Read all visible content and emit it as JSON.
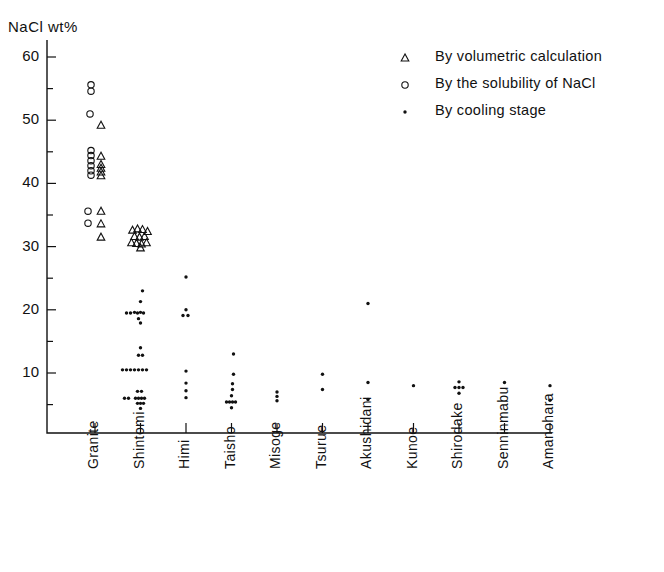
{
  "chart_data": {
    "type": "scatter",
    "title": "",
    "ylabel": "NaCl  wt%",
    "xlabel": "",
    "ylim": [
      2,
      62
    ],
    "yticks": [
      10,
      20,
      30,
      40,
      50,
      60
    ],
    "yminorticks": [
      5,
      15,
      25,
      35,
      45,
      55
    ],
    "grid": false,
    "legend_position": "top-right",
    "categories": [
      "Granite",
      "Shintomi",
      "Himi",
      "Taisho",
      "Misoge",
      "Tsurue",
      "Akushidani",
      "Kunoe",
      "Shirodake",
      "Senninmabu",
      "Amanohara"
    ],
    "series": [
      {
        "name": "By volumetric calculation",
        "marker": "open-triangle",
        "points": [
          {
            "category": "Granite",
            "x_offset": 6,
            "value": 49.2
          },
          {
            "category": "Granite",
            "x_offset": 6,
            "value": 44.3
          },
          {
            "category": "Granite",
            "x_offset": 6,
            "value": 43.0
          },
          {
            "category": "Granite",
            "x_offset": 6,
            "value": 42.4
          },
          {
            "category": "Granite",
            "x_offset": 6,
            "value": 41.8
          },
          {
            "category": "Granite",
            "x_offset": 6,
            "value": 41.2
          },
          {
            "category": "Granite",
            "x_offset": 6,
            "value": 35.6
          },
          {
            "category": "Granite",
            "x_offset": 6,
            "value": 33.6
          },
          {
            "category": "Granite",
            "x_offset": 6,
            "value": 31.5
          },
          {
            "category": "Shintomi",
            "x_offset": -8,
            "value": 32.6
          },
          {
            "category": "Shintomi",
            "x_offset": -3,
            "value": 32.8
          },
          {
            "category": "Shintomi",
            "x_offset": 2,
            "value": 32.7
          },
          {
            "category": "Shintomi",
            "x_offset": 7,
            "value": 32.4
          },
          {
            "category": "Shintomi",
            "x_offset": -6,
            "value": 31.6
          },
          {
            "category": "Shintomi",
            "x_offset": -1,
            "value": 31.5
          },
          {
            "category": "Shintomi",
            "x_offset": 4,
            "value": 31.6
          },
          {
            "category": "Shintomi",
            "x_offset": -9,
            "value": 30.6
          },
          {
            "category": "Shintomi",
            "x_offset": -4,
            "value": 30.5
          },
          {
            "category": "Shintomi",
            "x_offset": 1,
            "value": 30.4
          },
          {
            "category": "Shintomi",
            "x_offset": 6,
            "value": 30.6
          },
          {
            "category": "Shintomi",
            "x_offset": 0,
            "value": 29.8
          }
        ]
      },
      {
        "name": "By the solubility of NaCl",
        "marker": "open-circle",
        "points": [
          {
            "category": "Granite",
            "x_offset": -4,
            "value": 55.6
          },
          {
            "category": "Granite",
            "x_offset": -4,
            "value": 54.6
          },
          {
            "category": "Granite",
            "x_offset": -5,
            "value": 51.0
          },
          {
            "category": "Granite",
            "x_offset": -4,
            "value": 45.2
          },
          {
            "category": "Granite",
            "x_offset": -4,
            "value": 44.4
          },
          {
            "category": "Granite",
            "x_offset": -4,
            "value": 43.6
          },
          {
            "category": "Granite",
            "x_offset": -4,
            "value": 42.8
          },
          {
            "category": "Granite",
            "x_offset": -4,
            "value": 42.0
          },
          {
            "category": "Granite",
            "x_offset": -4,
            "value": 41.3
          },
          {
            "category": "Granite",
            "x_offset": -7,
            "value": 35.6
          },
          {
            "category": "Granite",
            "x_offset": -7,
            "value": 33.7
          }
        ]
      },
      {
        "name": "By cooling stage",
        "marker": "filled-dot",
        "points": [
          {
            "category": "Shintomi",
            "x_offset": 2,
            "value": 23.0
          },
          {
            "category": "Shintomi",
            "x_offset": 0,
            "value": 21.3
          },
          {
            "category": "Shintomi",
            "x_offset": -14,
            "value": 19.5
          },
          {
            "category": "Shintomi",
            "x_offset": -10,
            "value": 19.5
          },
          {
            "category": "Shintomi",
            "x_offset": -6,
            "value": 19.6
          },
          {
            "category": "Shintomi",
            "x_offset": -3,
            "value": 19.5
          },
          {
            "category": "Shintomi",
            "x_offset": 0,
            "value": 19.6
          },
          {
            "category": "Shintomi",
            "x_offset": 3,
            "value": 19.5
          },
          {
            "category": "Shintomi",
            "x_offset": -2,
            "value": 18.6
          },
          {
            "category": "Shintomi",
            "x_offset": 0,
            "value": 17.9
          },
          {
            "category": "Shintomi",
            "x_offset": 0,
            "value": 14.0
          },
          {
            "category": "Shintomi",
            "x_offset": -2,
            "value": 12.8
          },
          {
            "category": "Shintomi",
            "x_offset": 2,
            "value": 12.8
          },
          {
            "category": "Shintomi",
            "x_offset": -18,
            "value": 10.5
          },
          {
            "category": "Shintomi",
            "x_offset": -14,
            "value": 10.5
          },
          {
            "category": "Shintomi",
            "x_offset": -10,
            "value": 10.5
          },
          {
            "category": "Shintomi",
            "x_offset": -6,
            "value": 10.5
          },
          {
            "category": "Shintomi",
            "x_offset": -2,
            "value": 10.5
          },
          {
            "category": "Shintomi",
            "x_offset": 2,
            "value": 10.5
          },
          {
            "category": "Shintomi",
            "x_offset": 6,
            "value": 10.5
          },
          {
            "category": "Shintomi",
            "x_offset": -3,
            "value": 7.1
          },
          {
            "category": "Shintomi",
            "x_offset": 1,
            "value": 7.1
          },
          {
            "category": "Shintomi",
            "x_offset": -16,
            "value": 6.0
          },
          {
            "category": "Shintomi",
            "x_offset": -12,
            "value": 6.0
          },
          {
            "category": "Shintomi",
            "x_offset": -5,
            "value": 6.0
          },
          {
            "category": "Shintomi",
            "x_offset": -2,
            "value": 6.0
          },
          {
            "category": "Shintomi",
            "x_offset": 1,
            "value": 6.0
          },
          {
            "category": "Shintomi",
            "x_offset": 4,
            "value": 6.0
          },
          {
            "category": "Shintomi",
            "x_offset": -3,
            "value": 5.2
          },
          {
            "category": "Shintomi",
            "x_offset": 0,
            "value": 5.2
          },
          {
            "category": "Shintomi",
            "x_offset": 3,
            "value": 5.2
          },
          {
            "category": "Shintomi",
            "x_offset": 0,
            "value": 4.4
          },
          {
            "category": "Himi",
            "x_offset": 0,
            "value": 25.2
          },
          {
            "category": "Himi",
            "x_offset": 0,
            "value": 20.0
          },
          {
            "category": "Himi",
            "x_offset": -3,
            "value": 19.1
          },
          {
            "category": "Himi",
            "x_offset": 2,
            "value": 19.1
          },
          {
            "category": "Himi",
            "x_offset": 0,
            "value": 10.3
          },
          {
            "category": "Himi",
            "x_offset": 0,
            "value": 8.4
          },
          {
            "category": "Himi",
            "x_offset": 0,
            "value": 7.2
          },
          {
            "category": "Himi",
            "x_offset": 0,
            "value": 6.1
          },
          {
            "category": "Taisho",
            "x_offset": 2,
            "value": 13.0
          },
          {
            "category": "Taisho",
            "x_offset": 2,
            "value": 9.8
          },
          {
            "category": "Taisho",
            "x_offset": 1,
            "value": 8.3
          },
          {
            "category": "Taisho",
            "x_offset": 1,
            "value": 7.4
          },
          {
            "category": "Taisho",
            "x_offset": 0,
            "value": 6.4
          },
          {
            "category": "Taisho",
            "x_offset": -5,
            "value": 5.4
          },
          {
            "category": "Taisho",
            "x_offset": -2,
            "value": 5.4
          },
          {
            "category": "Taisho",
            "x_offset": 1,
            "value": 5.4
          },
          {
            "category": "Taisho",
            "x_offset": 4,
            "value": 5.4
          },
          {
            "category": "Taisho",
            "x_offset": 0,
            "value": 4.5
          },
          {
            "category": "Misoge",
            "x_offset": 0,
            "value": 7.0
          },
          {
            "category": "Misoge",
            "x_offset": 0,
            "value": 6.3
          },
          {
            "category": "Misoge",
            "x_offset": 0,
            "value": 5.6
          },
          {
            "category": "Tsurue",
            "x_offset": 0,
            "value": 9.8
          },
          {
            "category": "Tsurue",
            "x_offset": 0,
            "value": 7.4
          },
          {
            "category": "Akushidani",
            "x_offset": 0,
            "value": 21.0
          },
          {
            "category": "Akushidani",
            "x_offset": 0,
            "value": 8.5
          },
          {
            "category": "Akushidani",
            "x_offset": 0,
            "value": 5.8
          },
          {
            "category": "Kunoe",
            "x_offset": 0,
            "value": 8.0
          },
          {
            "category": "Shirodake",
            "x_offset": 0,
            "value": 8.6
          },
          {
            "category": "Shirodake",
            "x_offset": -4,
            "value": 7.7
          },
          {
            "category": "Shirodake",
            "x_offset": 0,
            "value": 7.7
          },
          {
            "category": "Shirodake",
            "x_offset": 4,
            "value": 7.7
          },
          {
            "category": "Shirodake",
            "x_offset": 0,
            "value": 6.8
          },
          {
            "category": "Senninmabu",
            "x_offset": 0,
            "value": 8.5
          },
          {
            "category": "Amanohara",
            "x_offset": 0,
            "value": 8.0
          },
          {
            "category": "Amanohara",
            "x_offset": 0,
            "value": 5.7
          }
        ]
      }
    ]
  },
  "legend": {
    "items": [
      {
        "label": "By volumetric calculation",
        "marker": "open-triangle"
      },
      {
        "label": "By the solubility of NaCl",
        "marker": "open-circle"
      },
      {
        "label": "By cooling stage",
        "marker": "filled-dot"
      }
    ]
  },
  "colors": {
    "ink": "#111111",
    "background": "#ffffff"
  }
}
